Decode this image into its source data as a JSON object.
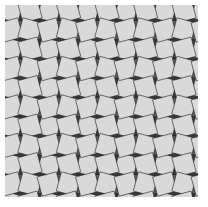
{
  "image": {
    "title": "Snub square tiling pattern",
    "kind": "geometric-tessellation",
    "colors": {
      "background": "#ffffff",
      "square": "#d9d9d9",
      "triangle_light": "#5e5e5e",
      "triangle_dark": "#3a3a3a",
      "edge": "#1a1a1a"
    },
    "frame": {
      "x": 5,
      "y": 5,
      "width": 193,
      "height": 192
    },
    "period_px": 38.5
  }
}
